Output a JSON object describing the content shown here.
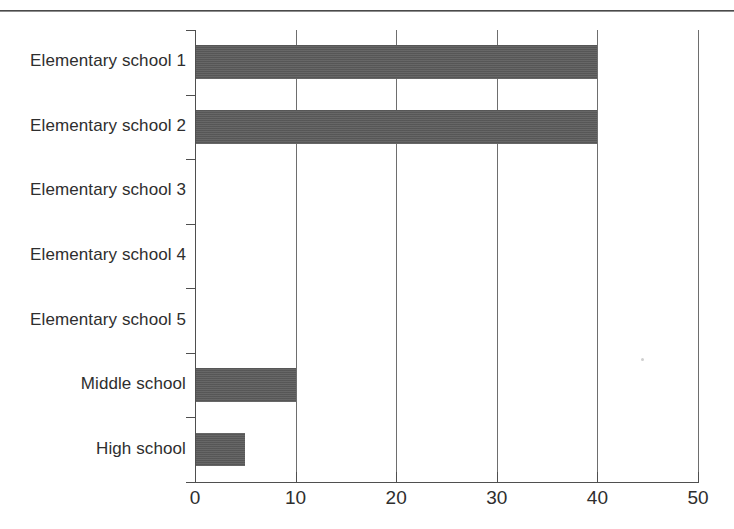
{
  "figure": {
    "width": 734,
    "height": 529,
    "background_color": "#ffffff",
    "rule_color": "#4a4a4a"
  },
  "chart_data": {
    "type": "bar",
    "orientation": "horizontal",
    "title": "",
    "subtitle": "",
    "xlabel": "",
    "ylabel": "",
    "categories": [
      "Elementary school 1",
      "Elementary school 2",
      "Elementary school 3",
      "Elementary school 4",
      "Elementary school 5",
      "Middle school",
      "High school"
    ],
    "values": [
      40,
      40,
      0,
      0,
      0,
      10,
      5
    ],
    "series": [
      {
        "name": "",
        "values": [
          40,
          40,
          0,
          0,
          0,
          10,
          5
        ]
      }
    ],
    "xlim": [
      0,
      50
    ],
    "xticks": [
      0,
      10,
      20,
      30,
      40,
      50
    ],
    "xtick_labels": [
      "0",
      "10",
      "20",
      "30",
      "40",
      "50"
    ],
    "grid": "vertical",
    "legend": "none",
    "bar_color": "#5b5b5b",
    "axis_color": "#4f4f4f",
    "gridline_color": "#6e6e6e",
    "text_color": "#2e2e2e",
    "annotations": []
  }
}
